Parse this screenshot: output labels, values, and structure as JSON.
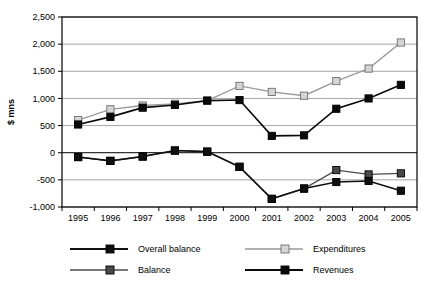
{
  "chart_data": {
    "type": "line",
    "title": "",
    "xlabel": "",
    "ylabel": "$ mns",
    "categories": [
      "1995",
      "1996",
      "1997",
      "1998",
      "1999",
      "2000",
      "2001",
      "2002",
      "2003",
      "2004",
      "2005"
    ],
    "ylim": [
      -1000,
      2500
    ],
    "ytick_values": [
      2500,
      2000,
      1500,
      1000,
      500,
      0,
      -500,
      -1000
    ],
    "ytick_labels": [
      "2,500",
      "2,000",
      "1,500",
      "1,000",
      "500",
      "0",
      "-500",
      "-1,000"
    ],
    "grid": true,
    "legend_position": "bottom",
    "series": [
      {
        "name": "Overall balance",
        "color": "#101010",
        "marker": "square",
        "marker_fill": "#101010",
        "values": [
          -80,
          -150,
          -70,
          40,
          20,
          -260,
          -850,
          -660,
          -540,
          -520,
          -700
        ]
      },
      {
        "name": "Expenditures",
        "color": "#9a9a9a",
        "marker": "square",
        "marker_fill": "#d5d5d5",
        "values": [
          600,
          800,
          870,
          900,
          960,
          1230,
          1120,
          1050,
          1320,
          1550,
          2030
        ]
      },
      {
        "name": "Balance",
        "color": "#4a4a4a",
        "marker": "square",
        "marker_fill": "#4a4a4a",
        "values": [
          -80,
          -150,
          -70,
          40,
          20,
          -260,
          -850,
          -660,
          -320,
          -400,
          -380
        ]
      },
      {
        "name": "Revenues",
        "color": "#0a0a0a",
        "marker": "square",
        "marker_fill": "#0a0a0a",
        "values": [
          520,
          660,
          830,
          880,
          960,
          970,
          310,
          320,
          810,
          1000,
          1250
        ]
      }
    ]
  },
  "legend": {
    "entries": [
      {
        "label": "Overall balance"
      },
      {
        "label": "Expenditures"
      },
      {
        "label": "Balance"
      },
      {
        "label": "Revenues"
      }
    ]
  }
}
